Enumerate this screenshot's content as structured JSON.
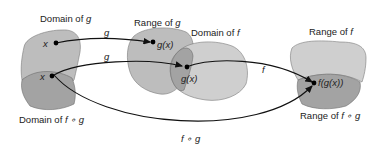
{
  "diagram": {
    "title_labels": {
      "domain_g": "Domain of ",
      "domain_g_var": "g",
      "range_g": "Range of ",
      "range_g_var": "g",
      "domain_f": "Domain of ",
      "domain_f_var": "f",
      "range_f": "Range of ",
      "range_f_var": "f",
      "domain_fog": "Domain of ",
      "domain_fog_var": "f ∘ g",
      "range_fog": "Range of ",
      "range_fog_var": "f ∘ g"
    },
    "points": {
      "x_top": "x",
      "x_bottom": "x",
      "gx_top": "g(x)",
      "gx_bottom": "g(x)",
      "fgx": "f(g(x))"
    },
    "arrows": {
      "g_top": "g",
      "g_bottom": "g",
      "f": "f",
      "fog": "f ∘ g"
    },
    "colors": {
      "light_region": "#bdbdbd",
      "lighter_region": "#cfcfcf",
      "dark_region": "#a3a3a3",
      "line": "#111111"
    }
  }
}
